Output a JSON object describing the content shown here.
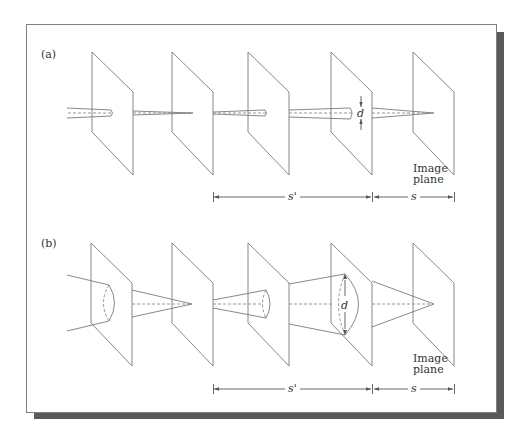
{
  "figure": {
    "colors": {
      "line": "#7a7a7a",
      "dash": "#8a8a8a",
      "frame": "#808080",
      "shadow": "#5a5a5a",
      "text": "#333333"
    }
  },
  "panels": [
    {
      "id": "a",
      "label": "(a)",
      "diameter_label": "d",
      "image_plane_label_line1": "Image",
      "image_plane_label_line2": "plane",
      "dim_s_prime": "s'",
      "dim_s": "s"
    },
    {
      "id": "b",
      "label": "(b)",
      "diameter_label": "d",
      "image_plane_label_line1": "Image",
      "image_plane_label_line2": "plane",
      "dim_s_prime": "s'",
      "dim_s": "s"
    }
  ]
}
